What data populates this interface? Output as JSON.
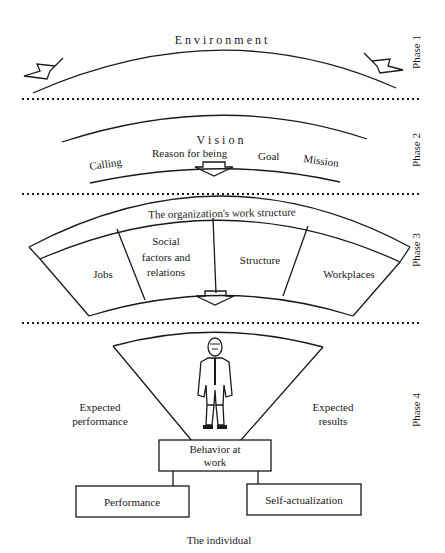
{
  "phases": {
    "phase1": {
      "label": "Phase 1",
      "title": "E n v i r o n m e n t"
    },
    "phase2": {
      "label": "Phase 2",
      "title": "V i s i o n",
      "terms": [
        "Calling",
        "Reason for being",
        "Goal",
        "Mission"
      ]
    },
    "phase3": {
      "label": "Phase 3",
      "title": "The organization's work structure",
      "cells": [
        "Jobs",
        "Social",
        "factors and",
        "relations",
        "Structure",
        "Workplaces"
      ]
    },
    "phase4": {
      "label": "Phase 4",
      "left_label": [
        "Expected",
        "performance"
      ],
      "right_label": [
        "Expected",
        "results"
      ],
      "center_box": [
        "Behavior at",
        "work"
      ],
      "outcomes": [
        "Performance",
        "Self-actualization"
      ],
      "caption": "The individual"
    }
  }
}
